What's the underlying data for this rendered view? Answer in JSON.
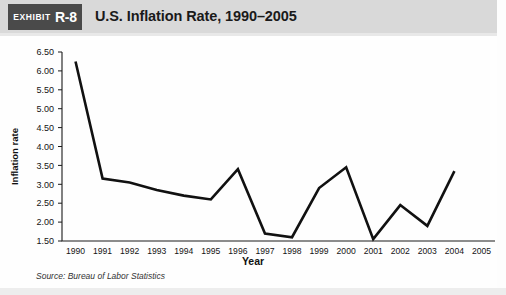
{
  "header": {
    "exhibit_word": "EXHIBIT",
    "exhibit_number": "R-8",
    "title": "U.S. Inflation Rate, 1990–2005",
    "band_color": "#d9d9d9",
    "tag_color": "#4a4a4a"
  },
  "footer": {
    "source": "Source: Bureau of Labor Statistics"
  },
  "chart_data": {
    "type": "line",
    "title": "U.S. Inflation Rate, 1990–2005",
    "xlabel": "Year",
    "ylabel": "Inflation rate",
    "categories": [
      "1990",
      "1991",
      "1992",
      "1993",
      "1994",
      "1995",
      "1996",
      "1997",
      "1998",
      "1999",
      "2000",
      "2001",
      "2002",
      "2003",
      "2004",
      "2005"
    ],
    "x_tick_labels": [
      "1990",
      "1991",
      "1992",
      "1993",
      "1994",
      "1995",
      "1996",
      "1997",
      "1998",
      "1999",
      "2000",
      "2001",
      "2002",
      "2003",
      "2004",
      "2005"
    ],
    "y_tick_labels": [
      "6.50",
      "6.00",
      "5.50",
      "5.00",
      "4.50",
      "4.00",
      "3.50",
      "3.00",
      "2.50",
      "2.00",
      "1.50"
    ],
    "y_ticks": [
      6.5,
      6.0,
      5.5,
      5.0,
      4.5,
      4.0,
      3.5,
      3.0,
      2.5,
      2.0,
      1.5
    ],
    "ylim": [
      1.5,
      6.5
    ],
    "grid": false,
    "legend": "none",
    "line_color": "#111111",
    "series": [
      {
        "name": "U.S. Inflation Rate",
        "x": [
          "1990",
          "1991",
          "1992",
          "1993",
          "1994",
          "1995",
          "1996",
          "1997",
          "1998",
          "1999",
          "2000",
          "2001",
          "2002",
          "2003",
          "2004"
        ],
        "values": [
          6.25,
          3.15,
          3.05,
          2.85,
          2.7,
          2.6,
          3.4,
          1.7,
          1.6,
          2.9,
          3.45,
          1.55,
          2.45,
          1.9,
          3.35
        ]
      }
    ]
  }
}
